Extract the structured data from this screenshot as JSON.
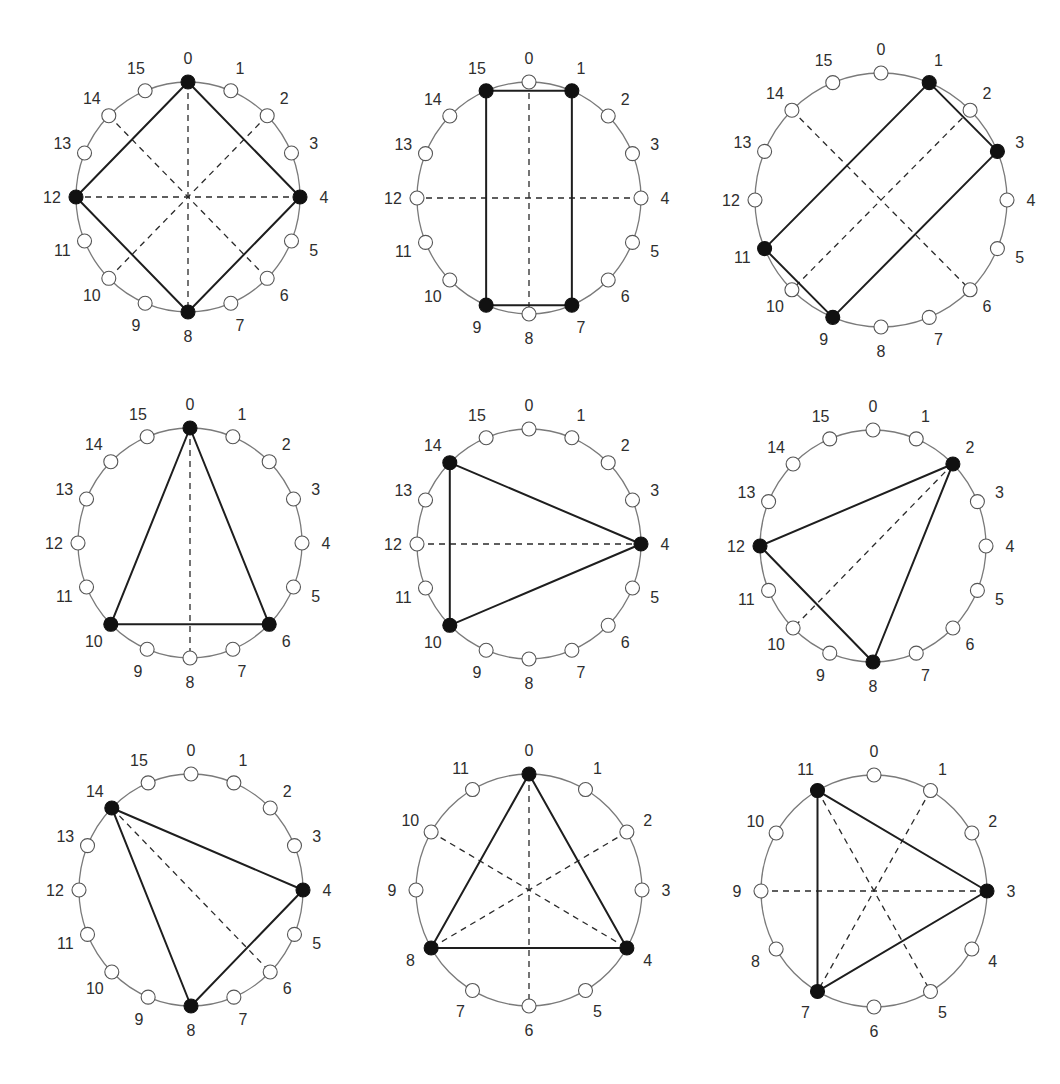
{
  "figure": {
    "background": "#ffffff",
    "colors": {
      "ring": "#7a7a7a",
      "filled_node": "#111111",
      "open_node_fill": "#ffffff",
      "solid_edge": "#1e1e1e",
      "dashed_edge": "#2a2a2a",
      "label": "#2e2e2e"
    },
    "diagrams": [
      {
        "id": "d1",
        "n": 16,
        "cx": 188,
        "cy": 197,
        "rx": 112,
        "ry": 115,
        "filled": [
          0,
          4,
          8,
          12
        ],
        "solid": [
          [
            0,
            4
          ],
          [
            4,
            8
          ],
          [
            8,
            12
          ],
          [
            12,
            0
          ]
        ],
        "dashed": [
          [
            0,
            8
          ],
          [
            4,
            12
          ],
          [
            2,
            10
          ],
          [
            14,
            6
          ]
        ],
        "labels": [
          "0",
          "1",
          "2",
          "3",
          "4",
          "5",
          "6",
          "7",
          "8",
          "9",
          "10",
          "11",
          "12",
          "13",
          "14",
          "15"
        ]
      },
      {
        "id": "d2",
        "n": 16,
        "cx": 529,
        "cy": 198,
        "rx": 112,
        "ry": 116,
        "filled": [
          1,
          7,
          9,
          15
        ],
        "solid": [
          [
            15,
            1
          ],
          [
            1,
            7
          ],
          [
            7,
            9
          ],
          [
            9,
            15
          ]
        ],
        "dashed": [
          [
            0,
            8
          ],
          [
            4,
            12
          ]
        ],
        "labels": [
          "0",
          "1",
          "2",
          "3",
          "4",
          "5",
          "6",
          "7",
          "8",
          "9",
          "10",
          "11",
          "12",
          "13",
          "14",
          "15"
        ]
      },
      {
        "id": "d3",
        "n": 16,
        "cx": 881,
        "cy": 200,
        "rx": 126,
        "ry": 127,
        "filled": [
          1,
          3,
          9,
          11
        ],
        "solid": [
          [
            1,
            3
          ],
          [
            3,
            9
          ],
          [
            9,
            11
          ],
          [
            11,
            1
          ]
        ],
        "dashed": [
          [
            2,
            10
          ],
          [
            14,
            6
          ]
        ],
        "labels": [
          "0",
          "1",
          "2",
          "3",
          "4",
          "5",
          "6",
          "7",
          "8",
          "9",
          "10",
          "11",
          "12",
          "13",
          "14",
          "15"
        ]
      },
      {
        "id": "d4",
        "n": 16,
        "cx": 190,
        "cy": 543,
        "rx": 112,
        "ry": 115,
        "filled": [
          0,
          6,
          10
        ],
        "solid": [
          [
            0,
            6
          ],
          [
            6,
            10
          ],
          [
            10,
            0
          ]
        ],
        "dashed": [
          [
            0,
            8
          ]
        ],
        "labels": [
          "0",
          "1",
          "2",
          "3",
          "4",
          "5",
          "6",
          "7",
          "8",
          "9",
          "10",
          "11",
          "12",
          "13",
          "14",
          "15"
        ]
      },
      {
        "id": "d5",
        "n": 16,
        "cx": 529,
        "cy": 544,
        "rx": 112,
        "ry": 115,
        "filled": [
          4,
          10,
          14
        ],
        "solid": [
          [
            14,
            4
          ],
          [
            4,
            10
          ],
          [
            10,
            14
          ]
        ],
        "dashed": [
          [
            12,
            4
          ]
        ],
        "labels": [
          "0",
          "1",
          "2",
          "3",
          "4",
          "5",
          "6",
          "7",
          "8",
          "9",
          "10",
          "11",
          "12",
          "13",
          "14",
          "15"
        ]
      },
      {
        "id": "d6",
        "n": 16,
        "cx": 873,
        "cy": 546,
        "rx": 113,
        "ry": 116,
        "filled": [
          2,
          8,
          12
        ],
        "solid": [
          [
            2,
            8
          ],
          [
            8,
            12
          ],
          [
            12,
            2
          ]
        ],
        "dashed": [
          [
            2,
            10
          ]
        ],
        "labels": [
          "0",
          "1",
          "2",
          "3",
          "4",
          "5",
          "6",
          "7",
          "8",
          "9",
          "10",
          "11",
          "12",
          "13",
          "14",
          "15"
        ]
      },
      {
        "id": "d7",
        "n": 16,
        "cx": 191,
        "cy": 890,
        "rx": 112,
        "ry": 116,
        "filled": [
          4,
          8,
          14
        ],
        "solid": [
          [
            14,
            4
          ],
          [
            4,
            8
          ],
          [
            8,
            14
          ]
        ],
        "dashed": [
          [
            14,
            6
          ]
        ],
        "labels": [
          "0",
          "1",
          "2",
          "3",
          "4",
          "5",
          "6",
          "7",
          "8",
          "9",
          "10",
          "11",
          "12",
          "13",
          "14",
          "15"
        ]
      },
      {
        "id": "d8",
        "n": 12,
        "cx": 529,
        "cy": 890,
        "rx": 113,
        "ry": 116,
        "filled": [
          0,
          4,
          8
        ],
        "solid": [
          [
            0,
            4
          ],
          [
            4,
            8
          ],
          [
            8,
            0
          ]
        ],
        "dashed": [
          [
            0,
            6
          ],
          [
            2,
            8
          ],
          [
            10,
            4
          ]
        ],
        "labels": [
          "0",
          "1",
          "2",
          "3",
          "4",
          "5",
          "6",
          "7",
          "8",
          "9",
          "10",
          "11"
        ]
      },
      {
        "id": "d9",
        "n": 12,
        "cx": 874,
        "cy": 891,
        "rx": 113,
        "ry": 116,
        "filled": [
          3,
          7,
          11
        ],
        "solid": [
          [
            11,
            3
          ],
          [
            3,
            7
          ],
          [
            7,
            11
          ]
        ],
        "dashed": [
          [
            9,
            3
          ],
          [
            11,
            5
          ],
          [
            1,
            7
          ]
        ],
        "labels": [
          "0",
          "1",
          "2",
          "3",
          "4",
          "5",
          "6",
          "7",
          "8",
          "9",
          "10",
          "11"
        ]
      }
    ]
  }
}
